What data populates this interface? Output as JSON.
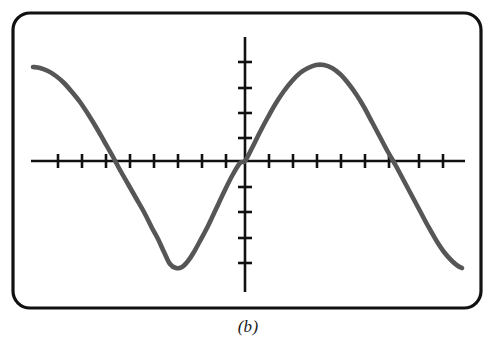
{
  "figure": {
    "caption": "(b)",
    "background_color": "#ffffff",
    "frame": {
      "name": "rounded-rectangle-frame",
      "x": 13,
      "y": 13,
      "width": 468,
      "height": 295,
      "corner_radius": 17,
      "stroke_color": "#111111",
      "stroke_width": 3.2
    },
    "axes": {
      "stroke_color": "#111111",
      "stroke_width": 2.6,
      "tick_length": 14,
      "x_axis": {
        "name": "x-axis",
        "y": 161,
        "x_start": 31,
        "x_end": 465,
        "tick_spacing": 24.1,
        "tick_positions": [
          58,
          82,
          106,
          130,
          154,
          178,
          202,
          226,
          269,
          293,
          317,
          341,
          365,
          389,
          419,
          443
        ]
      },
      "y_axis": {
        "name": "y-axis",
        "x": 245,
        "y_start": 37,
        "y_end": 292,
        "tick_spacing": 25.5,
        "tick_positions": [
          62,
          88,
          113,
          138,
          187,
          212,
          238,
          263
        ]
      },
      "origin": {
        "x": 245,
        "y": 161
      }
    }
  },
  "chart_data": {
    "type": "line",
    "title": "",
    "subtitle": "",
    "xlabel": "",
    "ylabel": "",
    "grid": false,
    "legend": null,
    "annotations": [
      "(b)"
    ],
    "series": [
      {
        "name": "sinusoid",
        "color": "#565656",
        "line_width": 4.6,
        "description": "cosine-like wave, approximately one full period across the plotting window, amplitude ~104 px, period ~290 px, descending through the origin",
        "x_pixel_range": [
          33,
          462
        ],
        "y_pixel_range": [
          65,
          268
        ],
        "zero_crossings_px": [
          106,
          245,
          396
        ],
        "extrema_px": [
          {
            "type": "maximum",
            "x": 33,
            "y": 67
          },
          {
            "type": "minimum",
            "x": 170,
            "y": 268
          },
          {
            "type": "maximum",
            "x": 320,
            "y": 65
          },
          {
            "type": "minimum",
            "x": 462,
            "y": 268
          }
        ],
        "points": [
          [
            33,
            67
          ],
          [
            40,
            68
          ],
          [
            48,
            71
          ],
          [
            56,
            76
          ],
          [
            64,
            83
          ],
          [
            72,
            92
          ],
          [
            80,
            102
          ],
          [
            88,
            114
          ],
          [
            96,
            127
          ],
          [
            104,
            141
          ],
          [
            112,
            155
          ],
          [
            120,
            170
          ],
          [
            128,
            184
          ],
          [
            136,
            198
          ],
          [
            144,
            212
          ],
          [
            152,
            228
          ],
          [
            158,
            239
          ],
          [
            164,
            252
          ],
          [
            170,
            264
          ],
          [
            176,
            268
          ],
          [
            182,
            267
          ],
          [
            188,
            261
          ],
          [
            194,
            252
          ],
          [
            200,
            241
          ],
          [
            208,
            226
          ],
          [
            216,
            209
          ],
          [
            224,
            192
          ],
          [
            232,
            176
          ],
          [
            240,
            163
          ],
          [
            245,
            161
          ],
          [
            252,
            148
          ],
          [
            260,
            132
          ],
          [
            268,
            117
          ],
          [
            276,
            103
          ],
          [
            284,
            91
          ],
          [
            292,
            81
          ],
          [
            300,
            73
          ],
          [
            308,
            68
          ],
          [
            316,
            65
          ],
          [
            324,
            65
          ],
          [
            332,
            68
          ],
          [
            340,
            74
          ],
          [
            348,
            83
          ],
          [
            356,
            94
          ],
          [
            364,
            107
          ],
          [
            372,
            122
          ],
          [
            380,
            137
          ],
          [
            388,
            152
          ],
          [
            396,
            166
          ],
          [
            404,
            181
          ],
          [
            412,
            196
          ],
          [
            420,
            211
          ],
          [
            428,
            226
          ],
          [
            436,
            240
          ],
          [
            444,
            252
          ],
          [
            452,
            261
          ],
          [
            458,
            266
          ],
          [
            462,
            268
          ]
        ]
      }
    ]
  }
}
